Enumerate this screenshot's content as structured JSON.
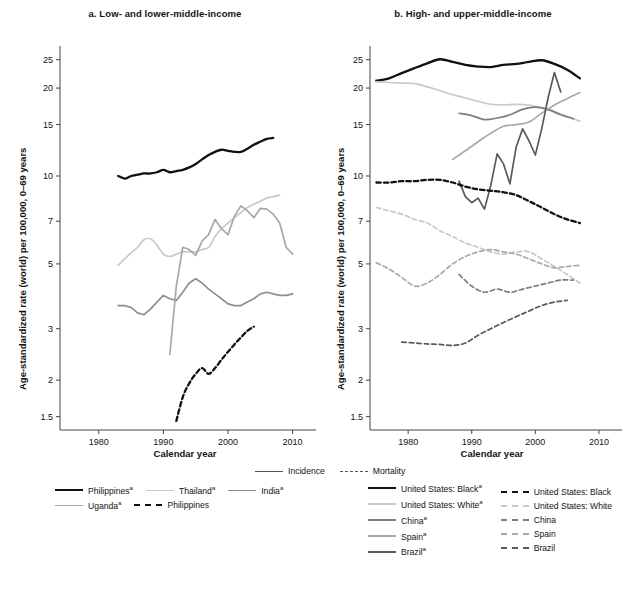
{
  "figure": {
    "panels": [
      {
        "id": "a",
        "title": "a. Low- and lower-middle-income"
      },
      {
        "id": "b",
        "title": "b. High- and upper-middle-income"
      }
    ],
    "axis": {
      "ylabel": "Age-standardized rate (world) per 100,000, 0–69 years",
      "xlabel": "Calendar year",
      "yticks": [
        "25",
        "20",
        "15",
        "10",
        "7",
        "5",
        "3",
        "2",
        "1.5"
      ],
      "xticks": [
        "1980",
        "1990",
        "2000",
        "2010"
      ]
    }
  },
  "legend_top": {
    "incidence": "Incidence",
    "mortality": "Mortality"
  },
  "legend_a": [
    {
      "label": "Philippines",
      "sup": "a",
      "style": "solid",
      "color": "#111111",
      "width": 2.6
    },
    {
      "label": "Thailand",
      "sup": "a",
      "style": "solid",
      "color": "#c9c9c9",
      "width": 1.8
    },
    {
      "label": "India",
      "sup": "a",
      "style": "solid",
      "color": "#8f8f8f",
      "width": 1.8
    },
    {
      "label": "Uganda",
      "sup": "a",
      "style": "solid",
      "color": "#a8a8a8",
      "width": 1.8
    },
    {
      "label": "Philippines",
      "sup": "",
      "style": "dashed",
      "color": "#111111",
      "width": 2.4
    }
  ],
  "legend_b_incidence": [
    {
      "label": "United States: Black",
      "sup": "a",
      "style": "solid",
      "color": "#111111",
      "width": 2.6
    },
    {
      "label": "United States: White",
      "sup": "a",
      "style": "solid",
      "color": "#c9c9c9",
      "width": 2.0
    },
    {
      "label": "China",
      "sup": "a",
      "style": "solid",
      "color": "#7d7d7d",
      "width": 2.0
    },
    {
      "label": "Spain",
      "sup": "a",
      "style": "solid",
      "color": "#a8a8a8",
      "width": 2.0
    },
    {
      "label": "Brazil",
      "sup": "a",
      "style": "solid",
      "color": "#5a5a5a",
      "width": 2.0
    }
  ],
  "legend_b_mortality": [
    {
      "label": "United States: Black",
      "sup": "",
      "style": "dashed",
      "color": "#111111",
      "width": 2.6
    },
    {
      "label": "United States: White",
      "sup": "",
      "style": "dashed",
      "color": "#c9c9c9",
      "width": 2.0
    },
    {
      "label": "China",
      "sup": "",
      "style": "dashed",
      "color": "#7d7d7d",
      "width": 2.0
    },
    {
      "label": "Spain",
      "sup": "",
      "style": "dashed",
      "color": "#a8a8a8",
      "width": 2.0
    },
    {
      "label": "Brazil",
      "sup": "",
      "style": "dashed",
      "color": "#5a5a5a",
      "width": 2.0
    }
  ],
  "chart_data": {
    "type": "line",
    "xlabel": "Calendar year",
    "ylabel": "Age-standardized rate (world) per 100,000, 0–69 years",
    "yscale": "log",
    "ylim": [
      1.35,
      27
    ],
    "xlim": [
      1974,
      2013
    ],
    "yticks": [
      25,
      20,
      15,
      10,
      7,
      5,
      3,
      2,
      1.5
    ],
    "xticks": [
      1980,
      1990,
      2000,
      2010
    ],
    "grid": false,
    "legend_position": "below",
    "panels": [
      {
        "id": "a",
        "title": "a. Low- and lower-middle-income",
        "series": [
          {
            "name": "Philippines",
            "measure": "incidence",
            "style": "solid",
            "color": "#111111",
            "x": [
              1983,
              1984,
              1985,
              1986,
              1987,
              1988,
              1989,
              1990,
              1991,
              1992,
              1993,
              1994,
              1995,
              1996,
              1997,
              1998,
              1999,
              2000,
              2001,
              2002,
              2003,
              2004,
              2005,
              2006,
              2007
            ],
            "y": [
              10.0,
              9.8,
              10.0,
              10.1,
              10.2,
              10.2,
              10.3,
              10.5,
              10.3,
              10.4,
              10.5,
              10.7,
              11.0,
              11.4,
              11.8,
              12.1,
              12.3,
              12.2,
              12.1,
              12.1,
              12.4,
              12.8,
              13.1,
              13.4,
              13.5
            ]
          },
          {
            "name": "Thailand",
            "measure": "incidence",
            "style": "solid",
            "color": "#c9c9c9",
            "x": [
              1983,
              1984,
              1985,
              1986,
              1987,
              1988,
              1989,
              1990,
              1991,
              1992,
              1993,
              1994,
              1995,
              1996,
              1997,
              1998,
              1999,
              2000,
              2001,
              2002,
              2003,
              2004,
              2005,
              2006,
              2007,
              2008
            ],
            "y": [
              4.95,
              5.2,
              5.45,
              5.7,
              6.05,
              6.1,
              5.8,
              5.4,
              5.3,
              5.4,
              5.5,
              5.5,
              5.5,
              5.6,
              5.7,
              6.2,
              6.6,
              6.9,
              7.2,
              7.5,
              7.8,
              8.0,
              8.2,
              8.4,
              8.5,
              8.6
            ]
          },
          {
            "name": "India",
            "measure": "incidence",
            "style": "solid",
            "color": "#8f8f8f",
            "x": [
              1983,
              1984,
              1985,
              1986,
              1987,
              1988,
              1989,
              1990,
              1991,
              1992,
              1993,
              1994,
              1995,
              1996,
              1997,
              1998,
              1999,
              2000,
              2001,
              2002,
              2003,
              2004,
              2005,
              2006,
              2007,
              2008,
              2009,
              2010
            ],
            "y": [
              3.6,
              3.6,
              3.55,
              3.4,
              3.35,
              3.5,
              3.7,
              3.9,
              3.8,
              3.75,
              4.0,
              4.3,
              4.45,
              4.3,
              4.1,
              3.95,
              3.8,
              3.65,
              3.6,
              3.6,
              3.7,
              3.8,
              3.95,
              4.0,
              3.95,
              3.9,
              3.9,
              3.95
            ]
          },
          {
            "name": "Uganda",
            "measure": "incidence",
            "style": "solid",
            "color": "#a8a8a8",
            "x": [
              1991,
              1992,
              1993,
              1994,
              1995,
              1996,
              1997,
              1998,
              1999,
              2000,
              2001,
              2002,
              2003,
              2004,
              2005,
              2006,
              2007,
              2008,
              2009,
              2010
            ],
            "y": [
              2.45,
              4.2,
              5.7,
              5.6,
              5.35,
              6.0,
              6.3,
              7.1,
              6.6,
              6.3,
              7.3,
              7.9,
              7.6,
              7.2,
              7.75,
              7.7,
              7.4,
              6.9,
              5.7,
              5.4
            ]
          },
          {
            "name": "Philippines",
            "measure": "mortality",
            "style": "dashed",
            "color": "#111111",
            "x": [
              1992,
              1993,
              1994,
              1995,
              1996,
              1997,
              1998,
              1999,
              2000,
              2001,
              2002,
              2003,
              2004
            ],
            "y": [
              1.45,
              1.75,
              1.95,
              2.1,
              2.2,
              2.1,
              2.2,
              2.35,
              2.5,
              2.65,
              2.8,
              2.95,
              3.05
            ]
          }
        ]
      },
      {
        "id": "b",
        "title": "b. High- and upper-middle-income",
        "series": [
          {
            "name": "United States: Black",
            "measure": "incidence",
            "style": "solid",
            "color": "#111111",
            "x": [
              1975,
              1977,
              1979,
              1981,
              1983,
              1985,
              1987,
              1989,
              1991,
              1993,
              1995,
              1997,
              1999,
              2001,
              2003,
              2005,
              2007
            ],
            "y": [
              21.2,
              21.6,
              22.5,
              23.4,
              24.3,
              25.1,
              24.6,
              24.0,
              23.7,
              23.6,
              24.0,
              24.2,
              24.6,
              24.9,
              24.2,
              23.1,
              21.6
            ]
          },
          {
            "name": "United States: White",
            "measure": "incidence",
            "style": "solid",
            "color": "#c9c9c9",
            "x": [
              1975,
              1977,
              1979,
              1981,
              1983,
              1985,
              1987,
              1989,
              1991,
              1993,
              1995,
              1997,
              1999,
              2001,
              2003,
              2005,
              2007
            ],
            "y": [
              21.0,
              20.9,
              20.8,
              20.7,
              20.2,
              19.6,
              19.0,
              18.5,
              18.0,
              17.6,
              17.5,
              17.6,
              17.5,
              17.1,
              16.6,
              16.0,
              15.4
            ]
          },
          {
            "name": "China",
            "measure": "incidence",
            "style": "solid",
            "color": "#7d7d7d",
            "x": [
              1988,
              1990,
              1992,
              1994,
              1996,
              1998,
              2000,
              2002,
              2004,
              2006
            ],
            "y": [
              16.4,
              16.1,
              15.6,
              15.8,
              16.2,
              16.9,
              17.2,
              16.9,
              16.2,
              15.7
            ]
          },
          {
            "name": "Spain",
            "measure": "incidence",
            "style": "solid",
            "color": "#a8a8a8",
            "x": [
              1987,
              1989,
              1991,
              1993,
              1995,
              1997,
              1999,
              2001,
              2003,
              2005,
              2007
            ],
            "y": [
              11.4,
              12.2,
              13.1,
              14.0,
              14.8,
              15.0,
              15.3,
              16.4,
              17.5,
              18.4,
              19.3
            ]
          },
          {
            "name": "Brazil",
            "measure": "incidence",
            "style": "solid",
            "color": "#5a5a5a",
            "x": [
              1988,
              1989,
              1990,
              1991,
              1992,
              1993,
              1994,
              1995,
              1996,
              1997,
              1998,
              1999,
              2000,
              2001,
              2002,
              2003,
              2004
            ],
            "y": [
              9.6,
              8.5,
              8.1,
              8.4,
              7.7,
              9.3,
              11.9,
              11.0,
              9.4,
              12.6,
              14.5,
              13.2,
              11.8,
              14.5,
              18.5,
              22.6,
              19.4
            ]
          },
          {
            "name": "United States: Black",
            "measure": "mortality",
            "style": "dashed",
            "color": "#111111",
            "x": [
              1975,
              1977,
              1979,
              1981,
              1983,
              1985,
              1987,
              1989,
              1991,
              1993,
              1995,
              1997,
              1999,
              2001,
              2003,
              2005,
              2007
            ],
            "y": [
              9.5,
              9.5,
              9.6,
              9.6,
              9.7,
              9.7,
              9.5,
              9.2,
              9.0,
              8.9,
              8.8,
              8.6,
              8.2,
              7.8,
              7.4,
              7.1,
              6.9
            ]
          },
          {
            "name": "United States: White",
            "measure": "mortality",
            "style": "dashed",
            "color": "#c9c9c9",
            "x": [
              1975,
              1977,
              1979,
              1981,
              1983,
              1985,
              1987,
              1989,
              1991,
              1993,
              1995,
              1997,
              1999,
              2001,
              2003,
              2005,
              2007
            ],
            "y": [
              7.8,
              7.6,
              7.4,
              7.1,
              6.9,
              6.5,
              6.2,
              5.9,
              5.7,
              5.5,
              5.4,
              5.5,
              5.5,
              5.2,
              4.9,
              4.6,
              4.3
            ]
          },
          {
            "name": "China",
            "measure": "mortality",
            "style": "dashed",
            "color": "#7d7d7d",
            "x": [
              1988,
              1990,
              1992,
              1994,
              1996,
              1998,
              2000,
              2002,
              2004,
              2006
            ],
            "y": [
              4.6,
              4.2,
              4.0,
              4.1,
              4.0,
              4.1,
              4.2,
              4.3,
              4.4,
              4.4
            ]
          },
          {
            "name": "Spain",
            "measure": "mortality",
            "style": "dashed",
            "color": "#a8a8a8",
            "x": [
              1975,
              1977,
              1979,
              1981,
              1983,
              1985,
              1987,
              1989,
              1991,
              1993,
              1995,
              1997,
              1999,
              2001,
              2003,
              2005,
              2007
            ],
            "y": [
              5.05,
              4.8,
              4.5,
              4.2,
              4.3,
              4.6,
              5.0,
              5.3,
              5.5,
              5.6,
              5.5,
              5.4,
              5.2,
              5.0,
              4.85,
              4.9,
              4.95
            ]
          },
          {
            "name": "Brazil",
            "measure": "mortality",
            "style": "dashed",
            "color": "#5a5a5a",
            "x": [
              1979,
              1981,
              1983,
              1985,
              1987,
              1989,
              1991,
              1993,
              1995,
              1997,
              1999,
              2001,
              2003,
              2005
            ],
            "y": [
              2.7,
              2.68,
              2.66,
              2.65,
              2.63,
              2.68,
              2.85,
              3.0,
              3.15,
              3.3,
              3.45,
              3.6,
              3.7,
              3.75
            ]
          }
        ]
      }
    ]
  }
}
